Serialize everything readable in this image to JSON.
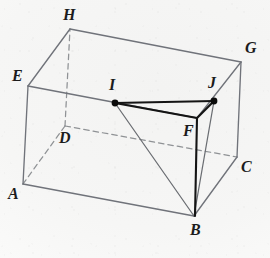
{
  "figure": {
    "shape": "rectangular-prism",
    "background_color": "#f7f7f6",
    "solid_edge_color": "#6f7275",
    "hidden_edge_color": "#8f9295",
    "highlight_edge_color": "#141414",
    "point_color": "#0b0b0b",
    "label_color": "#1c1c1c",
    "vertices": [
      {
        "name": "A",
        "x": 23,
        "y": 184,
        "label_x": 8,
        "label_y": 186,
        "hidden": false
      },
      {
        "name": "B",
        "x": 194,
        "y": 216,
        "label_x": 190,
        "label_y": 222,
        "hidden": false
      },
      {
        "name": "C",
        "x": 237,
        "y": 157,
        "label_x": 241,
        "label_y": 159,
        "hidden": false
      },
      {
        "name": "D",
        "x": 65,
        "y": 126,
        "label_x": 59,
        "label_y": 130,
        "hidden": true
      },
      {
        "name": "E",
        "x": 28,
        "y": 86,
        "label_x": 12,
        "label_y": 68,
        "hidden": false
      },
      {
        "name": "F",
        "x": 197,
        "y": 118,
        "label_x": 183,
        "label_y": 123,
        "hidden": false
      },
      {
        "name": "G",
        "x": 241,
        "y": 62,
        "label_x": 245,
        "label_y": 40,
        "hidden": false
      },
      {
        "name": "H",
        "x": 70,
        "y": 29,
        "label_x": 63,
        "label_y": 7,
        "hidden": false
      },
      {
        "name": "I",
        "x": 115,
        "y": 103,
        "label_x": 109,
        "label_y": 77,
        "hidden": false
      },
      {
        "name": "J",
        "x": 214,
        "y": 101,
        "label_x": 208,
        "label_y": 75,
        "hidden": false
      }
    ],
    "edges": [
      {
        "from": "A",
        "to": "B",
        "style": "solid"
      },
      {
        "from": "B",
        "to": "C",
        "style": "solid"
      },
      {
        "from": "C",
        "to": "D",
        "style": "dashed"
      },
      {
        "from": "D",
        "to": "A",
        "style": "dashed"
      },
      {
        "from": "E",
        "to": "F",
        "style": "solid"
      },
      {
        "from": "F",
        "to": "G",
        "style": "solid"
      },
      {
        "from": "G",
        "to": "H",
        "style": "solid"
      },
      {
        "from": "H",
        "to": "E",
        "style": "solid"
      },
      {
        "from": "A",
        "to": "E",
        "style": "solid"
      },
      {
        "from": "B",
        "to": "F",
        "style": "solid"
      },
      {
        "from": "C",
        "to": "G",
        "style": "solid"
      },
      {
        "from": "D",
        "to": "H",
        "style": "dashed"
      }
    ],
    "highlight_segments": [
      {
        "from": "I",
        "to": "J",
        "style": "solid-bold"
      },
      {
        "from": "I",
        "to": "F",
        "style": "solid-bold"
      },
      {
        "from": "J",
        "to": "F",
        "style": "solid-bold"
      },
      {
        "from": "F",
        "to": "B",
        "style": "solid-bold"
      },
      {
        "from": "I",
        "to": "B",
        "style": "solid-thin"
      },
      {
        "from": "J",
        "to": "B",
        "style": "solid-thin"
      }
    ],
    "marked_points": [
      "I",
      "J"
    ]
  }
}
